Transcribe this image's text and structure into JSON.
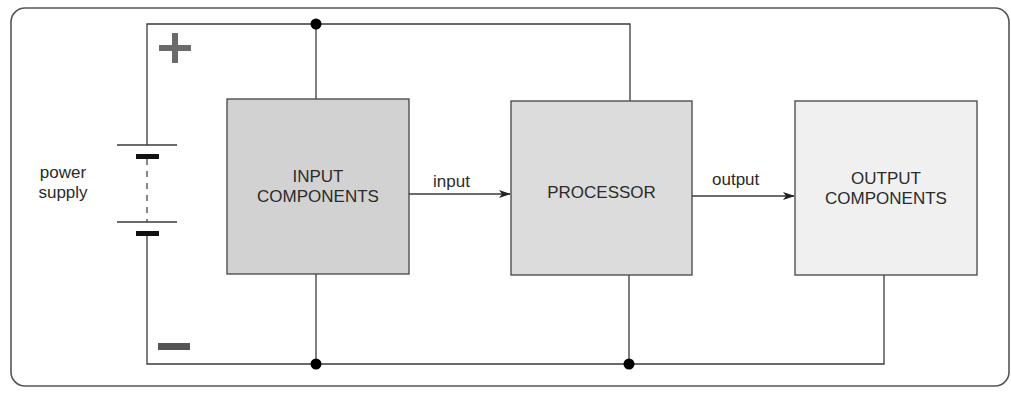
{
  "diagram": {
    "title": "",
    "power_supply": {
      "label_line1": "power",
      "label_line2": "supply",
      "positive_symbol": "+",
      "negative_symbol": "−"
    },
    "blocks": [
      {
        "id": "input",
        "line1": "INPUT",
        "line2": "COMPONENTS",
        "fill": "#d2d2d2"
      },
      {
        "id": "processor",
        "line1": "PROCESSOR",
        "line2": "",
        "fill": "#dcdcdc"
      },
      {
        "id": "output",
        "line1": "OUTPUT",
        "line2": "COMPONENTS",
        "fill": "#f0f0f0"
      }
    ],
    "arrows": [
      {
        "from": "input",
        "to": "processor",
        "label": "input"
      },
      {
        "from": "processor",
        "to": "output",
        "label": "output"
      }
    ],
    "colors": {
      "wire": "#3a3a3a",
      "border": "#555555",
      "polarity": "#6a6a6a",
      "junction": "#000000"
    }
  }
}
